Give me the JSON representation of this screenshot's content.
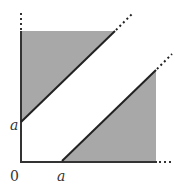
{
  "diagram": {
    "type": "region-plot",
    "labels": {
      "origin": "0",
      "x_tick": "a",
      "y_tick": "a"
    },
    "colors": {
      "fill": "#a8a8a8",
      "axis": "#333333",
      "line": "#222222"
    },
    "regions": [
      {
        "name": "upper-region",
        "bound": "y > x + a"
      },
      {
        "name": "lower-region",
        "bound": "y < x - a"
      }
    ]
  }
}
